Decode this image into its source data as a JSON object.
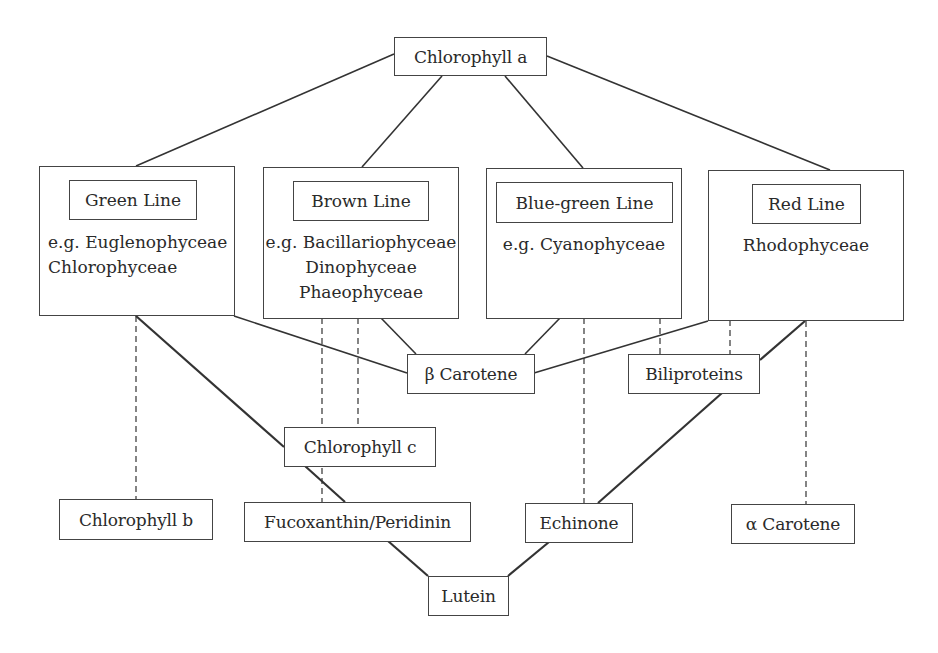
{
  "diagram": {
    "root": {
      "label": "Chlorophyll a"
    },
    "groups": [
      {
        "id": "green",
        "title": "Green Line",
        "members": [
          "e.g. Euglenophyceae",
          "Chlorophyceae"
        ]
      },
      {
        "id": "brown",
        "title": "Brown Line",
        "members": [
          "e.g. Bacillariophyceae",
          "Dinophyceae",
          "Phaeophyceae"
        ]
      },
      {
        "id": "bluegreen",
        "title": "Blue-green Line",
        "members": [
          "e.g. Cyanophyceae"
        ]
      },
      {
        "id": "red",
        "title": "Red Line",
        "members": [
          "Rhodophyceae"
        ]
      }
    ],
    "pigments": {
      "beta_carotene": "β Carotene",
      "biliproteins": "Biliproteins",
      "chlorophyll_c": "Chlorophyll c",
      "chlorophyll_b": "Chlorophyll b",
      "fucoxanthin": "Fucoxanthin/Peridinin",
      "echinone": "Echinone",
      "alpha_carotene": "α Carotene",
      "lutein": "Lutein"
    },
    "edges": [
      {
        "from": "Chlorophyll a",
        "to": "Green Line",
        "style": "solid"
      },
      {
        "from": "Chlorophyll a",
        "to": "Brown Line",
        "style": "solid"
      },
      {
        "from": "Chlorophyll a",
        "to": "Blue-green Line",
        "style": "solid"
      },
      {
        "from": "Chlorophyll a",
        "to": "Red Line",
        "style": "solid"
      },
      {
        "from": "Green Line",
        "to": "β Carotene",
        "style": "solid"
      },
      {
        "from": "Brown Line",
        "to": "β Carotene",
        "style": "solid"
      },
      {
        "from": "Blue-green Line",
        "to": "β Carotene",
        "style": "solid"
      },
      {
        "from": "Red Line",
        "to": "β Carotene",
        "style": "solid"
      },
      {
        "from": "Green Line",
        "to": "Chlorophyll b",
        "style": "dashed"
      },
      {
        "from": "Green Line",
        "to": "Chlorophyll c",
        "style": "bold"
      },
      {
        "from": "Chlorophyll c",
        "to": "Fucoxanthin/Peridinin",
        "style": "bold"
      },
      {
        "from": "Brown Line",
        "to": "Chlorophyll c",
        "style": "dashed"
      },
      {
        "from": "Brown Line",
        "to": "Fucoxanthin/Peridinin",
        "style": "dashed"
      },
      {
        "from": "Blue-green Line",
        "to": "Echinone",
        "style": "dashed"
      },
      {
        "from": "Blue-green Line",
        "to": "Biliproteins",
        "style": "dashed"
      },
      {
        "from": "Red Line",
        "to": "Biliproteins",
        "style": "dashed"
      },
      {
        "from": "Red Line",
        "to": "Biliproteins",
        "style": "bold"
      },
      {
        "from": "Biliproteins",
        "to": "Echinone",
        "style": "bold"
      },
      {
        "from": "Red Line",
        "to": "α Carotene",
        "style": "dashed"
      },
      {
        "from": "Fucoxanthin/Peridinin",
        "to": "Lutein",
        "style": "bold"
      },
      {
        "from": "Echinone",
        "to": "Lutein",
        "style": "bold"
      }
    ]
  }
}
